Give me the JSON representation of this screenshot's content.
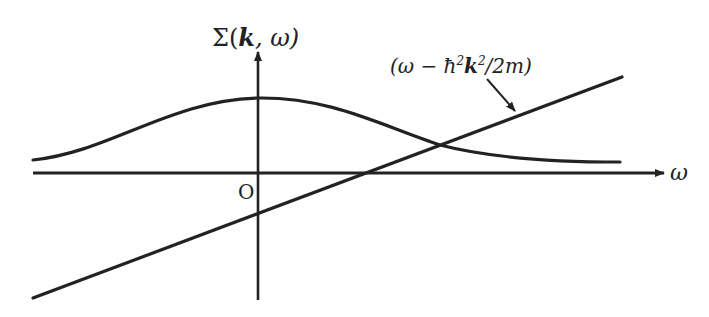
{
  "diagram": {
    "y_axis": {
      "label_prefix": "Σ(",
      "label_k": "k",
      "label_suffix": ", ω)"
    },
    "x_axis": {
      "label": "ω"
    },
    "origin_label": "O",
    "line_label": {
      "open": "(ω − ħ",
      "sup1": "2",
      "k": "k",
      "sup2": "2",
      "close": "/2m)"
    },
    "colors": {
      "stroke": "#222222",
      "background": "#ffffff"
    },
    "curves": [
      {
        "name": "sigma-curve",
        "type": "bell",
        "description": "Σ(k,ω) bell-shaped curve peaked at ω=0"
      },
      {
        "name": "free-particle-line",
        "type": "line",
        "description": "ω − ħ²k²/2m straight line"
      }
    ]
  }
}
